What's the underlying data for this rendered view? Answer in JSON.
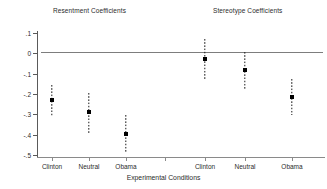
{
  "chart_data": {
    "type": "scatter",
    "title": "",
    "panels": [
      {
        "name": "Resentment Coefficients"
      },
      {
        "name": "Stereotype Coefficients"
      }
    ],
    "xlabel": "Experimental Conditions",
    "ylabel": "",
    "ylim": [
      -0.5,
      0.1
    ],
    "yticks": [
      0.1,
      0,
      -0.1,
      -0.2,
      -0.3,
      -0.4,
      -0.5
    ],
    "ytick_labels": [
      ".1",
      "0",
      "-.1",
      "-.2",
      "-.3",
      "-.4",
      "-.5"
    ],
    "categories": [
      "Clinton",
      "Neutral",
      "Obama",
      "Clinton",
      "Neutral",
      "Obama"
    ],
    "grid": false,
    "legend": null,
    "zero_reference_line": 0,
    "marker": "square",
    "errorbar_style": "dashed",
    "series": [
      {
        "name": "Resentment Coefficients",
        "points": [
          {
            "condition": "Clinton",
            "estimate": -0.23,
            "ci_low": -0.31,
            "ci_high": -0.155
          },
          {
            "condition": "Neutral",
            "estimate": -0.29,
            "ci_low": -0.39,
            "ci_high": -0.195
          },
          {
            "condition": "Obama",
            "estimate": -0.395,
            "ci_low": -0.49,
            "ci_high": -0.305
          }
        ]
      },
      {
        "name": "Stereotype Coefficients",
        "points": [
          {
            "condition": "Clinton",
            "estimate": -0.03,
            "ci_low": -0.13,
            "ci_high": 0.07
          },
          {
            "condition": "Neutral",
            "estimate": -0.08,
            "ci_low": -0.175,
            "ci_high": 0.005
          },
          {
            "condition": "Obama",
            "estimate": -0.215,
            "ci_low": -0.305,
            "ci_high": -0.125
          }
        ]
      }
    ]
  },
  "titles": {
    "resentment": "Resentment Coefficients",
    "stereotype": "Stereotype Coefficients"
  },
  "axis": {
    "x_label": "Experimental Conditions"
  }
}
